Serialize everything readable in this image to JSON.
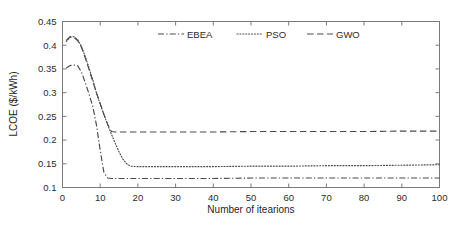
{
  "chart_data": {
    "type": "line",
    "title": "",
    "xlabel": "Number of itearions",
    "ylabel": "LCOE ($/kWh)",
    "xlim": [
      0,
      100
    ],
    "ylim": [
      0.1,
      0.45
    ],
    "xticks": [
      0,
      10,
      20,
      30,
      40,
      50,
      60,
      70,
      80,
      90,
      100
    ],
    "xtick_labels": [
      "0",
      "10",
      "20",
      "30",
      "40",
      "50",
      "60",
      "70",
      "80",
      "90",
      "100"
    ],
    "yticks": [
      0.1,
      0.15,
      0.2,
      0.25,
      0.3,
      0.35,
      0.4,
      0.45
    ],
    "ytick_labels": [
      "0.1",
      "0.15",
      "0.2",
      "0.25",
      "0.3",
      "0.35",
      "0.4",
      "0.45"
    ],
    "grid": false,
    "legend_position": "top-center-inside",
    "series": [
      {
        "name": "EBEA",
        "linestyle": "dashdot",
        "color": "#4a4a4a",
        "x": [
          1,
          2,
          3,
          4,
          5,
          6,
          7,
          8,
          9,
          10,
          11,
          12,
          13,
          15,
          20,
          30,
          40,
          50,
          60,
          70,
          80,
          90,
          100
        ],
        "values": [
          0.352,
          0.357,
          0.358,
          0.357,
          0.344,
          0.322,
          0.298,
          0.272,
          0.232,
          0.178,
          0.131,
          0.12,
          0.119,
          0.119,
          0.119,
          0.119,
          0.119,
          0.12,
          0.12,
          0.12,
          0.12,
          0.12,
          0.12
        ]
      },
      {
        "name": "PSO",
        "linestyle": "dotted",
        "color": "#6e6e6e",
        "x": [
          1,
          2,
          3,
          4,
          5,
          6,
          7,
          8,
          9,
          10,
          11,
          12,
          13,
          14,
          15,
          16,
          17,
          18,
          20,
          30,
          40,
          50,
          60,
          70,
          80,
          90,
          100
        ],
        "values": [
          0.408,
          0.417,
          0.418,
          0.412,
          0.398,
          0.377,
          0.353,
          0.328,
          0.3,
          0.276,
          0.253,
          0.232,
          0.212,
          0.193,
          0.175,
          0.16,
          0.15,
          0.145,
          0.144,
          0.144,
          0.144,
          0.145,
          0.145,
          0.146,
          0.146,
          0.147,
          0.148
        ]
      },
      {
        "name": "GWO",
        "linestyle": "dashed",
        "color": "#4a4a4a",
        "x": [
          1,
          2,
          3,
          4,
          5,
          6,
          7,
          8,
          9,
          10,
          11,
          12,
          13,
          14,
          20,
          30,
          40,
          50,
          60,
          70,
          80,
          90,
          100
        ],
        "values": [
          0.41,
          0.418,
          0.417,
          0.41,
          0.396,
          0.374,
          0.35,
          0.325,
          0.3,
          0.277,
          0.254,
          0.233,
          0.218,
          0.217,
          0.217,
          0.217,
          0.217,
          0.218,
          0.218,
          0.218,
          0.218,
          0.219,
          0.219
        ]
      }
    ]
  },
  "legend": {
    "items": [
      {
        "label": "EBEA",
        "style": "dashdot"
      },
      {
        "label": "PSO",
        "style": "dotted"
      },
      {
        "label": "GWO",
        "style": "dashed"
      }
    ]
  }
}
